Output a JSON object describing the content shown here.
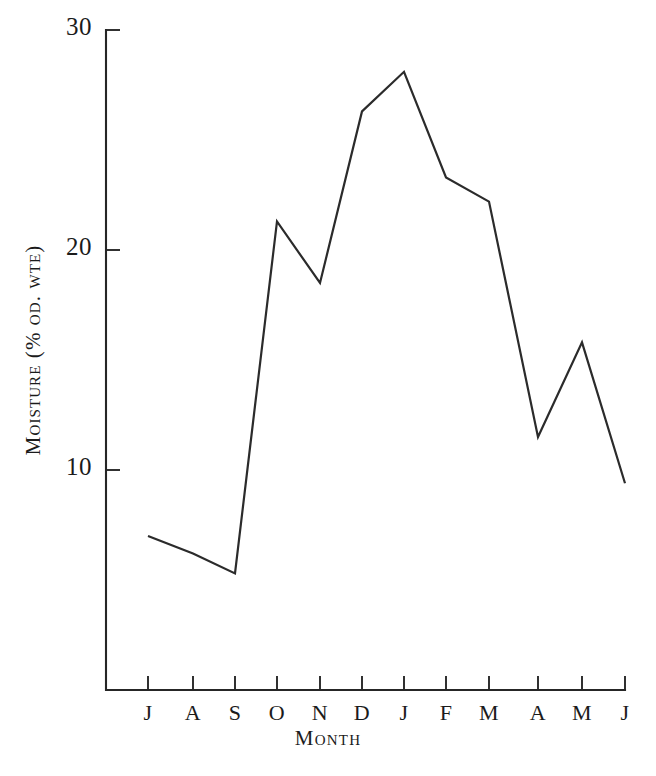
{
  "chart_data": {
    "type": "line",
    "title": "",
    "xlabel": "Month",
    "ylabel": "Moisture (% od. wte)",
    "categories": [
      "J",
      "A",
      "S",
      "O",
      "N",
      "D",
      "J",
      "F",
      "M",
      "A",
      "M",
      "J"
    ],
    "values": [
      7.0,
      6.2,
      5.3,
      21.3,
      18.5,
      26.3,
      28.1,
      23.3,
      22.2,
      11.5,
      15.8,
      9.4
    ],
    "ylim": [
      0,
      30
    ],
    "yticks": [
      10,
      20,
      30
    ],
    "ytick_labels": [
      "10",
      "20",
      "30"
    ],
    "xtick_labels": [
      "J",
      "A",
      "S",
      "O",
      "N",
      "D",
      "J",
      "F",
      "M",
      "A",
      "M",
      "J"
    ],
    "grid": false,
    "legend": false,
    "legend_position": "none",
    "line_color": "#2b2b2b",
    "axis_color": "#262626",
    "background_color": "#ffffff",
    "markers": false,
    "series": [
      {
        "name": "Moisture",
        "values": [
          7.0,
          6.2,
          5.3,
          21.3,
          18.5,
          26.3,
          28.1,
          23.3,
          22.2,
          11.5,
          15.8,
          9.4
        ]
      }
    ]
  },
  "geometry": {
    "x_positions": [
      148,
      193,
      235,
      277,
      320,
      362,
      404,
      446,
      489,
      538,
      582,
      625
    ],
    "y_top_value": 30,
    "y_top_px": 30,
    "px_per_unit": 22,
    "axis_x": 106,
    "axis_bottom_y": 690,
    "axis_top_y": 30,
    "axis_right_x": 625
  }
}
